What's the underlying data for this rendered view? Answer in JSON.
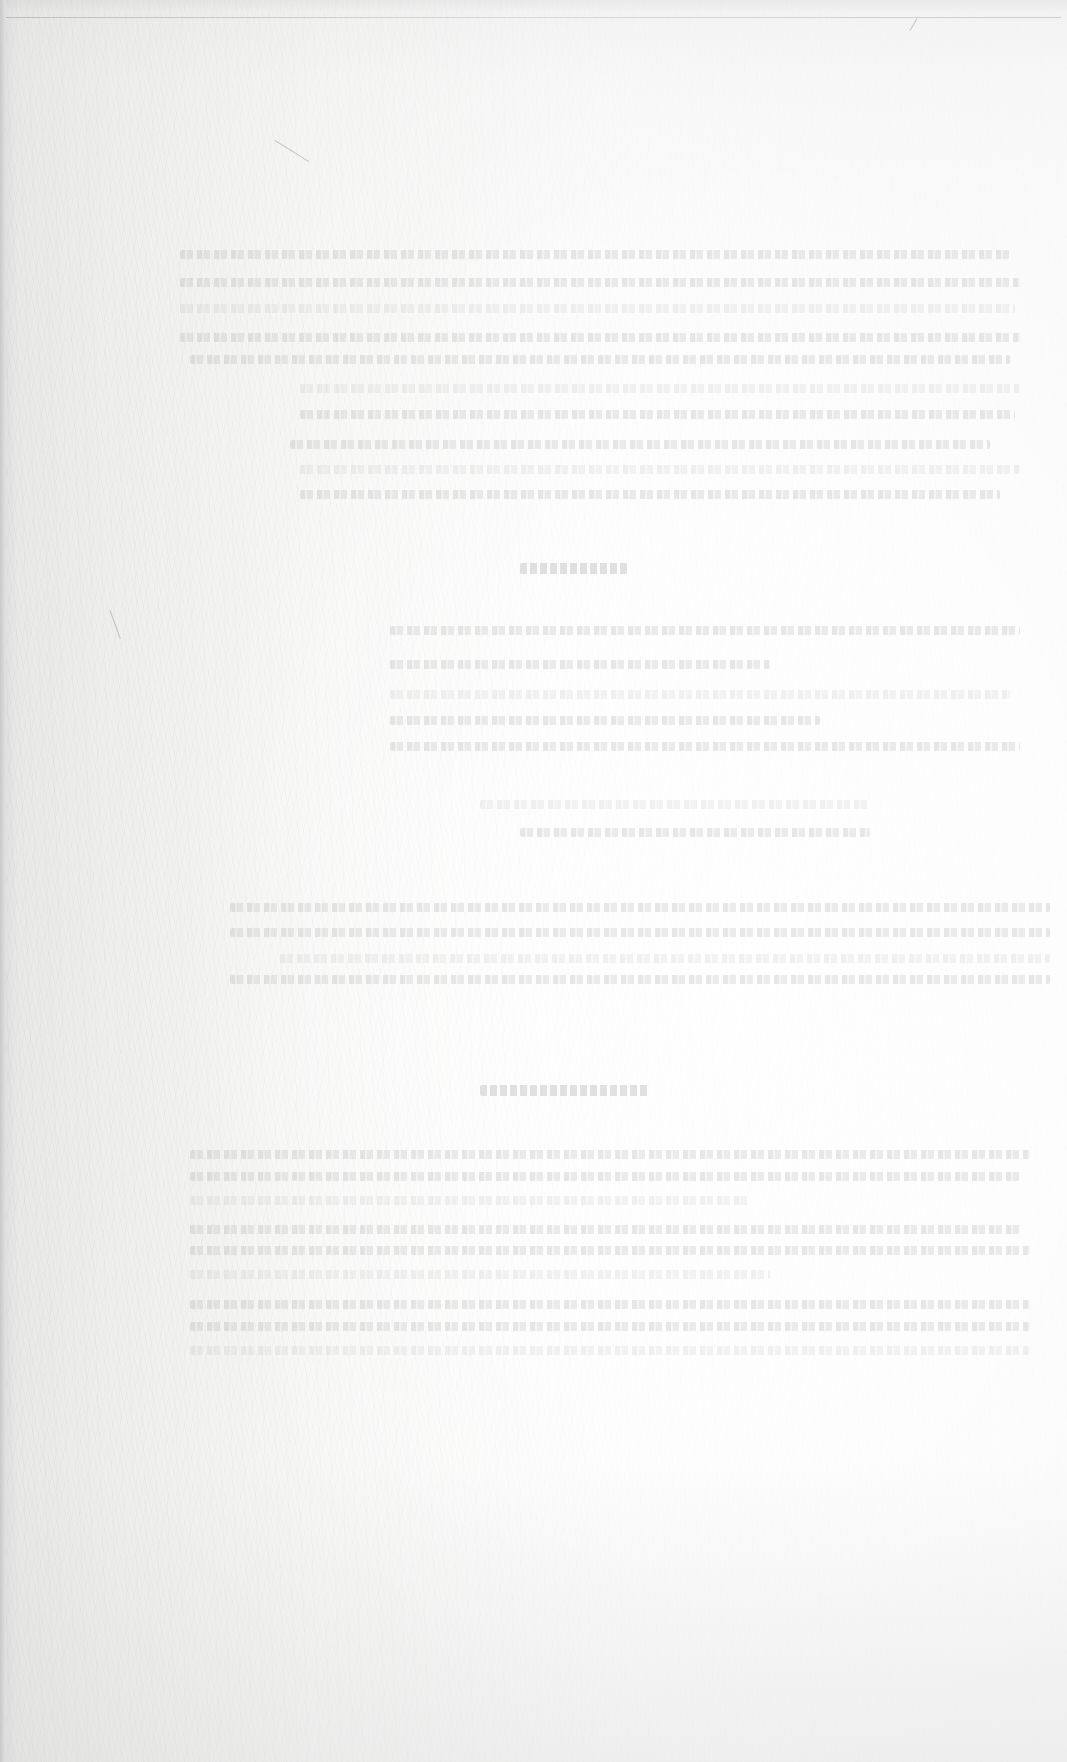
{
  "document": {
    "type": "scanned-page",
    "condition": "heavily faded / bleached scan; text not legible",
    "paper_color": "#f7f7f6",
    "edge_color": "#d6d6d6",
    "ink_color": "#969696"
  },
  "sections": [
    {
      "role": "paragraph-block",
      "text": "[illegible]",
      "lines": [
        {
          "top": 250,
          "left": 180,
          "width": 830
        },
        {
          "top": 278,
          "left": 180,
          "width": 840
        },
        {
          "top": 304,
          "left": 180,
          "width": 835
        },
        {
          "top": 333,
          "left": 180,
          "width": 840
        },
        {
          "top": 355,
          "left": 190,
          "width": 820
        },
        {
          "top": 384,
          "left": 300,
          "width": 720
        },
        {
          "top": 410,
          "left": 300,
          "width": 715
        },
        {
          "top": 440,
          "left": 290,
          "width": 700
        },
        {
          "top": 465,
          "left": 300,
          "width": 720
        },
        {
          "top": 490,
          "left": 300,
          "width": 700
        }
      ]
    },
    {
      "role": "heading",
      "text": "[illegible]",
      "lines": [
        {
          "top": 563,
          "left": 520,
          "width": 110
        }
      ]
    },
    {
      "role": "paragraph-block",
      "text": "[illegible]",
      "lines": [
        {
          "top": 626,
          "left": 390,
          "width": 630
        },
        {
          "top": 660,
          "left": 390,
          "width": 380
        },
        {
          "top": 690,
          "left": 390,
          "width": 620
        },
        {
          "top": 716,
          "left": 390,
          "width": 430
        },
        {
          "top": 742,
          "left": 390,
          "width": 630
        },
        {
          "top": 800,
          "left": 480,
          "width": 390
        },
        {
          "top": 828,
          "left": 520,
          "width": 350
        }
      ]
    },
    {
      "role": "paragraph-block",
      "text": "[illegible]",
      "lines": [
        {
          "top": 903,
          "left": 230,
          "width": 820
        },
        {
          "top": 928,
          "left": 230,
          "width": 820
        },
        {
          "top": 954,
          "left": 280,
          "width": 770
        },
        {
          "top": 975,
          "left": 230,
          "width": 820
        }
      ]
    },
    {
      "role": "heading",
      "text": "[illegible]",
      "lines": [
        {
          "top": 1085,
          "left": 480,
          "width": 170
        }
      ]
    },
    {
      "role": "paragraph-block",
      "text": "[illegible]",
      "lines": [
        {
          "top": 1150,
          "left": 190,
          "width": 840
        },
        {
          "top": 1172,
          "left": 190,
          "width": 830
        },
        {
          "top": 1196,
          "left": 190,
          "width": 560
        },
        {
          "top": 1225,
          "left": 190,
          "width": 830
        },
        {
          "top": 1246,
          "left": 190,
          "width": 840
        },
        {
          "top": 1270,
          "left": 190,
          "width": 580
        },
        {
          "top": 1300,
          "left": 190,
          "width": 840
        },
        {
          "top": 1322,
          "left": 190,
          "width": 840
        },
        {
          "top": 1346,
          "left": 190,
          "width": 840
        }
      ]
    }
  ]
}
